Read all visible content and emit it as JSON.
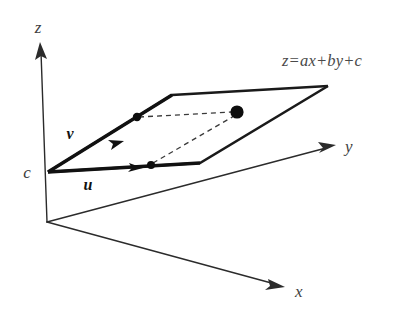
{
  "figure": {
    "background_color": "#ffffff",
    "ink_color": "#1a1a1a",
    "width": 417,
    "height": 328
  },
  "axes": {
    "z": {
      "label": "z",
      "label_x": 38,
      "label_y": 33
    },
    "y": {
      "label": "y",
      "label_x": 345,
      "label_y": 152
    },
    "x": {
      "label": "x",
      "label_x": 295,
      "label_y": 297
    },
    "origin": {
      "x": 47,
      "y": 222
    }
  },
  "labels": {
    "plane_equation": "z=ax+by+c",
    "plane_equation_x": 282,
    "plane_equation_y": 66,
    "intercept": "c",
    "intercept_x": 27,
    "intercept_y": 178,
    "vector_u": "u",
    "vector_u_x": 88,
    "vector_u_y": 190,
    "vector_v": "v",
    "vector_v_x": 70,
    "vector_v_y": 139
  },
  "geometry": {
    "plane_vertices": [
      {
        "name": "c-corner",
        "x": 48,
        "y": 172
      },
      {
        "name": "v-corner",
        "x": 172,
        "y": 95
      },
      {
        "name": "far-corner",
        "x": 328,
        "y": 86
      },
      {
        "name": "u-corner",
        "x": 200,
        "y": 163
      }
    ],
    "vector_u": {
      "from_x": 48,
      "from_y": 172,
      "to_x": 200,
      "to_y": 163,
      "arrow_t": 0.61
    },
    "vector_v": {
      "from_x": 48,
      "from_y": 172,
      "to_x": 172,
      "to_y": 95,
      "arrow_t": 0.55
    },
    "points": [
      {
        "name": "u-tip-point",
        "x": 151,
        "y": 165,
        "r": 4.0
      },
      {
        "name": "v-tip-point",
        "x": 137,
        "y": 117,
        "r": 4.2
      },
      {
        "name": "sum-point",
        "x": 237,
        "y": 112,
        "r": 6.6
      }
    ],
    "dashed_links": [
      {
        "name": "v-to-sum",
        "x1": 137,
        "y1": 117,
        "x2": 237,
        "y2": 112
      },
      {
        "name": "u-to-sum",
        "x1": 151,
        "y1": 165,
        "x2": 237,
        "y2": 112
      }
    ]
  }
}
